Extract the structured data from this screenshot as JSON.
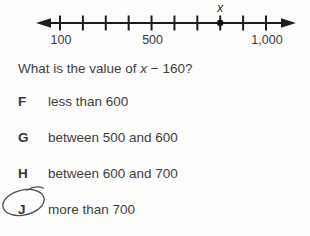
{
  "page": {
    "background": "#fdfdfc",
    "text_color": "#3e3e3e",
    "line_color": "#1d1d1d"
  },
  "chart_data": {
    "type": "number-line",
    "min": 100,
    "max": 1000,
    "tick_step": 100,
    "labeled_values": [
      100,
      500,
      1000
    ],
    "tick_labels": [
      "100",
      "500",
      "1,000"
    ],
    "point": {
      "value": 800,
      "label": "x"
    }
  },
  "question": {
    "prefix": "What is the value of ",
    "variable": "x",
    "suffix": " − 160?"
  },
  "choices": [
    {
      "letter": "F",
      "text": "less than 600",
      "circled": false
    },
    {
      "letter": "G",
      "text": "between 500 and 600",
      "circled": false
    },
    {
      "letter": "H",
      "text": "between 600 and 700",
      "circled": false
    },
    {
      "letter": "J",
      "text": "more than 700",
      "circled": true
    }
  ]
}
